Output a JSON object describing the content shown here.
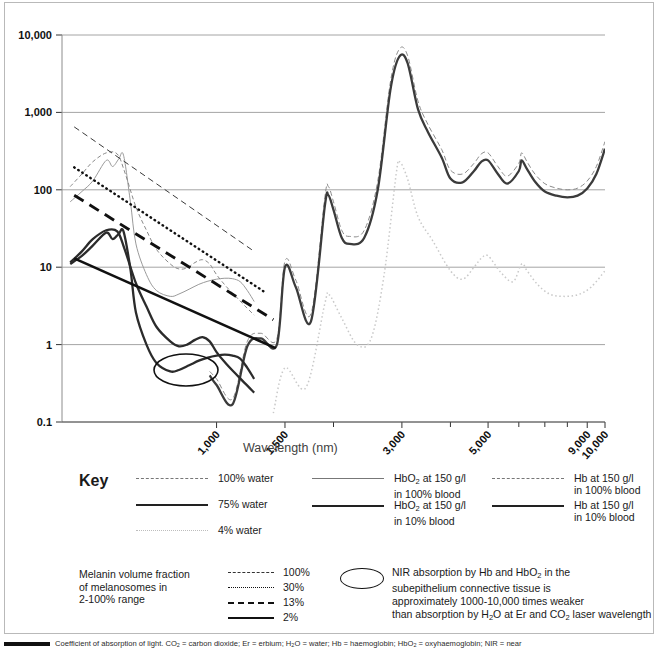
{
  "chart_data": {
    "type": "line",
    "title": "",
    "xlabel": "Wavelength (nm)",
    "ylabel": "Coefficient of absorption (cm-1)",
    "xscale": "log",
    "yscale": "log",
    "xlim": [
      400,
      10000
    ],
    "ylim": [
      0.1,
      10000
    ],
    "xticks": [
      "1,000",
      "1,500",
      "3,000",
      "5,000",
      "9,000",
      "10,000"
    ],
    "xtick_values": [
      1000,
      1500,
      3000,
      5000,
      9000,
      10000
    ],
    "yticks": [
      "10,000",
      "1,000",
      "100",
      "10",
      "1",
      "0.1"
    ],
    "ytick_values": [
      10000,
      1000,
      100,
      10,
      1,
      0.1
    ],
    "grid": "horizontal",
    "legend_position": "below",
    "series": [
      {
        "name": "100% water",
        "style": "thin-dashed",
        "x": [
          960,
          1000,
          1100,
          1200,
          1300,
          1430,
          1500,
          1600,
          1750,
          1900,
          1940,
          2000,
          2100,
          2200,
          2400,
          2600,
          2800,
          2950,
          3100,
          3300,
          3500,
          3800,
          4000,
          4300,
          4600,
          4800,
          5000,
          5300,
          5600,
          6000,
          6100,
          6300,
          6600,
          7000,
          7500,
          8000,
          8500,
          9000,
          9500,
          10000
        ],
        "y": [
          0.45,
          0.36,
          0.2,
          1.1,
          1.4,
          1.2,
          12,
          6.8,
          2.5,
          80,
          110,
          70,
          30,
          25,
          30,
          130,
          2400,
          6500,
          5500,
          1400,
          700,
          330,
          180,
          160,
          220,
          290,
          300,
          200,
          150,
          220,
          300,
          230,
          160,
          120,
          105,
          100,
          105,
          130,
          200,
          420
        ]
      },
      {
        "name": "75% water",
        "style": "thick-solid",
        "x": [
          960,
          1000,
          1100,
          1200,
          1300,
          1430,
          1500,
          1600,
          1750,
          1900,
          1940,
          2000,
          2100,
          2200,
          2400,
          2600,
          2800,
          2950,
          3100,
          3300,
          3500,
          3800,
          4000,
          4300,
          4600,
          4800,
          5000,
          5300,
          5600,
          6000,
          6100,
          6300,
          6600,
          7000,
          7500,
          8000,
          8500,
          9000,
          9500,
          10000
        ],
        "y": [
          0.4,
          0.3,
          0.17,
          0.95,
          1.2,
          1.0,
          10,
          5.5,
          2.0,
          62,
          85,
          55,
          24,
          20,
          24,
          100,
          1900,
          5200,
          4400,
          1100,
          560,
          260,
          140,
          125,
          175,
          230,
          240,
          160,
          120,
          175,
          240,
          185,
          128,
          95,
          84,
          80,
          84,
          104,
          160,
          340
        ]
      },
      {
        "name": "4% water",
        "style": "dotted-light",
        "x": [
          1400,
          1500,
          1700,
          1900,
          1950,
          2100,
          2300,
          2500,
          2700,
          2900,
          2960,
          3100,
          3300,
          3600,
          4000,
          4300,
          4600,
          4800,
          5000,
          5400,
          5800,
          6100,
          6300,
          6700,
          7200,
          7800,
          8500,
          9200,
          10000
        ],
        "y": [
          0.13,
          0.5,
          0.28,
          3.4,
          4.4,
          2.2,
          1.0,
          1.2,
          8,
          160,
          230,
          140,
          45,
          22,
          9,
          7,
          10,
          13,
          14,
          8.5,
          6.5,
          11,
          9,
          6,
          4.5,
          4.2,
          4.4,
          5.5,
          9
        ]
      },
      {
        "name": "HbO2 at 150 g/l in 100% blood",
        "style": "thin-solid",
        "x": [
          420,
          450,
          480,
          520,
          540,
          560,
          576,
          600,
          620,
          660,
          700,
          760,
          800,
          850,
          900,
          950,
          1000,
          1050,
          1100,
          1150,
          1200,
          1250
        ],
        "y": [
          70,
          95,
          130,
          240,
          200,
          250,
          280,
          70,
          20,
          8,
          5.0,
          4.2,
          4.5,
          5.2,
          6.0,
          6.6,
          7.0,
          7.2,
          7.1,
          6.5,
          5.0,
          3.6
        ]
      },
      {
        "name": "HbO2 at 150 g/l in 10% blood",
        "style": "thick-solid2",
        "x": [
          420,
          450,
          480,
          520,
          540,
          560,
          576,
          600,
          620,
          660,
          700,
          760,
          800,
          850,
          900,
          950,
          1000,
          1050,
          1100,
          1150,
          1200,
          1250
        ],
        "y": [
          11,
          14,
          19,
          28,
          23,
          27,
          29,
          9.5,
          2.6,
          1.0,
          0.58,
          0.45,
          0.47,
          0.54,
          0.62,
          0.68,
          0.72,
          0.74,
          0.72,
          0.66,
          0.5,
          0.36
        ]
      },
      {
        "name": "Hb at 150 g/l in 100% blood",
        "style": "thin-dashed2",
        "x": [
          420,
          450,
          480,
          520,
          555,
          580,
          620,
          660,
          700,
          760,
          800,
          840,
          880,
          920,
          960,
          1000,
          1060,
          1120,
          1180,
          1250
        ],
        "y": [
          110,
          160,
          230,
          300,
          290,
          170,
          60,
          30,
          17,
          11,
          9.5,
          9.8,
          11.5,
          12.5,
          11.0,
          8.0,
          5.6,
          4.2,
          3.2,
          2.4
        ]
      },
      {
        "name": "Hb at 150 g/l in 10% blood",
        "style": "thick-solid3",
        "x": [
          420,
          450,
          480,
          520,
          555,
          580,
          620,
          660,
          700,
          760,
          800,
          840,
          880,
          920,
          960,
          1000,
          1060,
          1120,
          1180,
          1250
        ],
        "y": [
          11.5,
          16,
          23,
          30,
          29,
          17,
          6.2,
          3.1,
          1.7,
          1.1,
          0.95,
          1.0,
          1.15,
          1.25,
          1.1,
          0.8,
          0.56,
          0.42,
          0.32,
          0.24
        ]
      },
      {
        "name": "Melanin 100%",
        "style": "mel-thindash",
        "x": [
          430,
          1250
        ],
        "y": [
          650,
          16
        ]
      },
      {
        "name": "Melanin 30%",
        "style": "mel-dotted",
        "x": [
          430,
          1320
        ],
        "y": [
          195,
          4.9
        ]
      },
      {
        "name": "Melanin 13%",
        "style": "mel-dashed",
        "x": [
          430,
          1400
        ],
        "y": [
          85,
          2.1
        ]
      },
      {
        "name": "Melanin 2%",
        "style": "mel-solid",
        "x": [
          430,
          1420
        ],
        "y": [
          13.0,
          0.9
        ]
      }
    ]
  },
  "key": {
    "title": "Key",
    "column1": [
      {
        "label": "100% water",
        "swatch": "thin-dashed"
      },
      {
        "label": "75% water",
        "swatch": "thick-solid"
      },
      {
        "label": "4% water",
        "swatch": "dotted-light"
      }
    ],
    "column2": [
      {
        "line1": "HbO2 at 150 g/l",
        "line2": "in 100% blood",
        "swatch": "thin-solid"
      },
      {
        "line1": "HbO2 at 150 g/l",
        "line2": "in 10% blood",
        "swatch": "thick-solid"
      }
    ],
    "column3": [
      {
        "line1": "Hb at 150 g/l",
        "line2": "in 100% blood",
        "swatch": "thin-dashed"
      },
      {
        "line1": "Hb at 150 g/l",
        "line2": "in 10% blood",
        "swatch": "thick-solid"
      }
    ],
    "melanin_title_line1": "Melanin volume fraction",
    "melanin_title_line2": "of melanosomes in",
    "melanin_title_line3": "2-100% range",
    "melanin_items": [
      {
        "label": "100%",
        "swatch": "mel-thindash"
      },
      {
        "label": "30%",
        "swatch": "mel-dotted"
      },
      {
        "label": "13%",
        "swatch": "mel-dashed"
      },
      {
        "label": "2%",
        "swatch": "mel-solid"
      }
    ],
    "note_lines": [
      "NIR absorption by Hb and HbO2 in the",
      "subepithelium connective tissue is",
      "approximately 1000-10,000 times weaker",
      "than absorption by H2O at Er and CO2 laser wavelength"
    ]
  },
  "caption": "Coefficient of absorption of light. CO2 = carbon dioxide; Er = erbium; H2O = water; Hb = haemoglobin; HbO2 = oxyhaemoglobin; NIR = near"
}
